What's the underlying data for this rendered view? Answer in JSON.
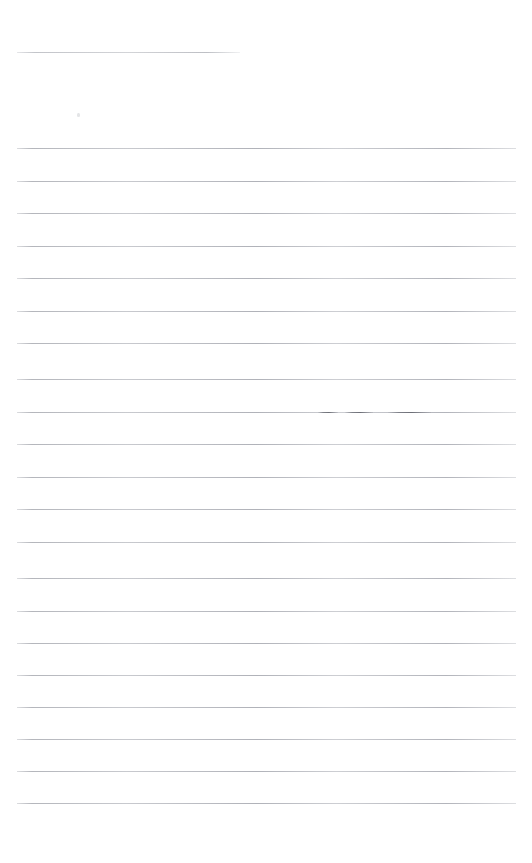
{
  "document": {
    "kind": "scanned-ruled-paper",
    "page_width": 532,
    "page_height": 863,
    "background_color": "#ffffff",
    "rule_color": "#c9cbcf",
    "mark_color": "#6c6e76",
    "text_content": "",
    "notes_label": "",
    "rule_left": 17,
    "rule_right": 516,
    "rule_spacing": 32.7,
    "rule_count": 22,
    "visible_text": []
  },
  "rules": [
    {
      "id": "rule-top-short",
      "y": 52,
      "x": 17,
      "width": 223,
      "variant": "short"
    },
    {
      "id": "rule-1",
      "y": 148,
      "x": 17,
      "width": 499,
      "variant": "full"
    },
    {
      "id": "rule-2",
      "y": 181,
      "x": 17,
      "width": 499,
      "variant": "full"
    },
    {
      "id": "rule-3",
      "y": 213,
      "x": 17,
      "width": 499,
      "variant": "full"
    },
    {
      "id": "rule-4",
      "y": 246,
      "x": 17,
      "width": 499,
      "variant": "full"
    },
    {
      "id": "rule-5",
      "y": 278,
      "x": 17,
      "width": 499,
      "variant": "full"
    },
    {
      "id": "rule-6",
      "y": 311,
      "x": 17,
      "width": 499,
      "variant": "full"
    },
    {
      "id": "rule-7",
      "y": 343,
      "x": 17,
      "width": 499,
      "variant": "full"
    },
    {
      "id": "rule-8",
      "y": 379,
      "x": 17,
      "width": 499,
      "variant": "full"
    },
    {
      "id": "rule-9",
      "y": 412,
      "x": 17,
      "width": 499,
      "variant": "full"
    },
    {
      "id": "rule-10",
      "y": 444,
      "x": 17,
      "width": 499,
      "variant": "full"
    },
    {
      "id": "rule-11",
      "y": 477,
      "x": 17,
      "width": 499,
      "variant": "full"
    },
    {
      "id": "rule-12",
      "y": 509,
      "x": 17,
      "width": 499,
      "variant": "full"
    },
    {
      "id": "rule-13",
      "y": 542,
      "x": 17,
      "width": 499,
      "variant": "full"
    },
    {
      "id": "rule-14",
      "y": 578,
      "x": 17,
      "width": 499,
      "variant": "full"
    },
    {
      "id": "rule-15",
      "y": 611,
      "x": 17,
      "width": 499,
      "variant": "full"
    },
    {
      "id": "rule-16",
      "y": 643,
      "x": 17,
      "width": 499,
      "variant": "full"
    },
    {
      "id": "rule-17",
      "y": 675,
      "x": 17,
      "width": 499,
      "variant": "full"
    },
    {
      "id": "rule-18",
      "y": 707,
      "x": 17,
      "width": 499,
      "variant": "full"
    },
    {
      "id": "rule-19",
      "y": 739,
      "x": 17,
      "width": 499,
      "variant": "full"
    },
    {
      "id": "rule-20",
      "y": 771,
      "x": 17,
      "width": 499,
      "variant": "full"
    },
    {
      "id": "rule-21",
      "y": 803,
      "x": 17,
      "width": 499,
      "variant": "full"
    }
  ],
  "marks": [
    {
      "id": "mark-1",
      "y": 412,
      "x": 318,
      "width": 20
    },
    {
      "id": "mark-2",
      "y": 412,
      "x": 345,
      "width": 28
    },
    {
      "id": "mark-3",
      "y": 412,
      "x": 388,
      "width": 43
    }
  ],
  "specks": [
    {
      "id": "speck-1",
      "x": 77,
      "y": 113,
      "width": 3,
      "height": 4
    }
  ]
}
